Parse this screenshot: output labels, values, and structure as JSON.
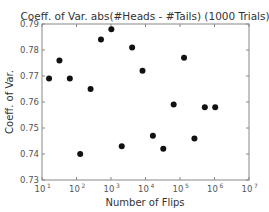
{
  "chart_data": {
    "type": "scatter",
    "title": "Coeff. of Var. abs(#Heads - #Tails) (1000 Trials)",
    "xlabel": "Number of Flips",
    "ylabel": "Coeff. of Var.",
    "xscale": "log",
    "xlim": [
      10,
      10000000
    ],
    "ylim": [
      0.73,
      0.79
    ],
    "grid": false,
    "legend": null,
    "x_ticks": [
      "10^1",
      "10^2",
      "10^3",
      "10^4",
      "10^5",
      "10^6",
      "10^7"
    ],
    "y_ticks": [
      "0.73",
      "0.74",
      "0.75",
      "0.76",
      "0.77",
      "0.78",
      "0.79"
    ],
    "marker_color": "#111111",
    "x": [
      16,
      32,
      64,
      128,
      256,
      512,
      1024,
      2048,
      4096,
      8192,
      16384,
      32768,
      65536,
      131072,
      262144,
      524288,
      1048576
    ],
    "y": [
      0.769,
      0.776,
      0.769,
      0.74,
      0.765,
      0.784,
      0.788,
      0.743,
      0.781,
      0.772,
      0.747,
      0.742,
      0.759,
      0.777,
      0.746,
      0.758,
      0.758
    ]
  }
}
